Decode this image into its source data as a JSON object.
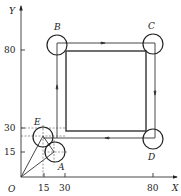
{
  "diagram": {
    "type": "cnc-tool-path",
    "axes": {
      "x_label": "X",
      "y_label": "Y",
      "origin_label": "O",
      "x_ticks": [
        "15",
        "30",
        "80"
      ],
      "y_ticks": [
        "15",
        "30",
        "80"
      ]
    },
    "points": {
      "A": "A",
      "B": "B",
      "C": "C",
      "D": "D",
      "E": "E"
    },
    "path_order": [
      "A",
      "E",
      "B",
      "C",
      "D",
      "E"
    ],
    "colors": {
      "line": "#333333",
      "background": "#ffffff"
    }
  }
}
